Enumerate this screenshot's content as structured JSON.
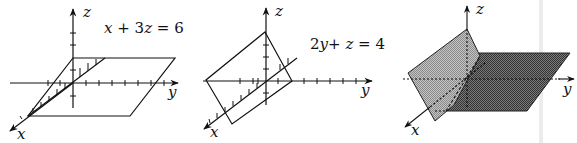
{
  "figure": {
    "panels": [
      {
        "id": "panel-1",
        "equation": {
          "parts": [
            "x",
            " + 3",
            "z",
            " = 6"
          ]
        },
        "axes": {
          "x": "x",
          "y": "y",
          "z": "z"
        },
        "description": "plane parallel to y-axis"
      },
      {
        "id": "panel-2",
        "equation": {
          "parts": [
            "2",
            "y",
            "+ ",
            "z",
            " = 4"
          ]
        },
        "axes": {
          "x": "x",
          "y": "y",
          "z": "z"
        },
        "description": "plane parallel to x-axis"
      },
      {
        "id": "panel-3",
        "equation": null,
        "axes": {
          "x": "x",
          "y": "y",
          "z": "z"
        },
        "description": "two intersecting planes (shaded)"
      }
    ],
    "colors": {
      "line": "#111111",
      "light_plane": "#a9a9a9",
      "dark_plane": "#5a5a5a",
      "divider": "#ececec"
    }
  }
}
